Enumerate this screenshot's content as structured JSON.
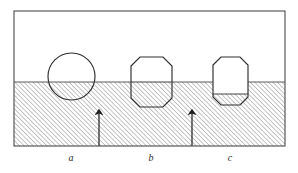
{
  "figure": {
    "kind": "buoyancy-diagram",
    "frame": {
      "x": 14,
      "y": 11,
      "width": 271,
      "height": 135,
      "stroke": "#4a4a4a",
      "stroke_width": 1.1,
      "fill": "#ffffff"
    },
    "fluid": {
      "name": "hatched-fluid-region",
      "surface_y": 82,
      "x": 14,
      "y": 82,
      "width": 271,
      "height": 64,
      "hatch_angle_deg": 45,
      "hatch_color": "#5a5a5a",
      "hatch_spacing": 3.2,
      "hatch_line_width": 0.7
    },
    "bodies": [
      {
        "id": "a",
        "name": "floating-circle-a",
        "shape": "circle",
        "cx": 71.5,
        "cy": 76.5,
        "r": 23.5,
        "submerged_fraction": 0.62,
        "label": "a",
        "label_x": 71,
        "label_y": 161,
        "stroke": "#2e2e2e",
        "stroke_width": 1.15
      },
      {
        "id": "b",
        "name": "floating-octagon-b",
        "shape": "octagon",
        "x": 131,
        "y": 57,
        "width": 41,
        "height": 50,
        "corner": 9,
        "submerged_fraction": 0.5,
        "label": "b",
        "label_x": 151,
        "label_y": 161,
        "stroke": "#2e2e2e",
        "stroke_width": 1.15
      },
      {
        "id": "c",
        "name": "floating-octagon-c",
        "shape": "octagon",
        "x": 213,
        "y": 57,
        "width": 35,
        "height": 48,
        "corner": 8,
        "submerged_fraction": 0.39,
        "label": "c",
        "label_x": 230,
        "label_y": 161,
        "stroke": "#2e2e2e",
        "stroke_width": 1.15
      }
    ],
    "arrows": [
      {
        "id": "arrow-left",
        "name": "buoyancy-arrow-left",
        "x": 99,
        "y_base": 146,
        "y_tip": 110,
        "direction": "up",
        "stroke": "#1d1d1d",
        "stroke_width": 1.2,
        "head_width": 4,
        "head_length": 7
      },
      {
        "id": "arrow-right",
        "name": "buoyancy-arrow-right",
        "x": 192,
        "y_base": 146,
        "y_tip": 110,
        "direction": "up",
        "stroke": "#1d1d1d",
        "stroke_width": 1.2,
        "head_width": 4,
        "head_length": 7
      }
    ],
    "labels": {
      "a": "a",
      "b": "b",
      "c": "c"
    }
  }
}
